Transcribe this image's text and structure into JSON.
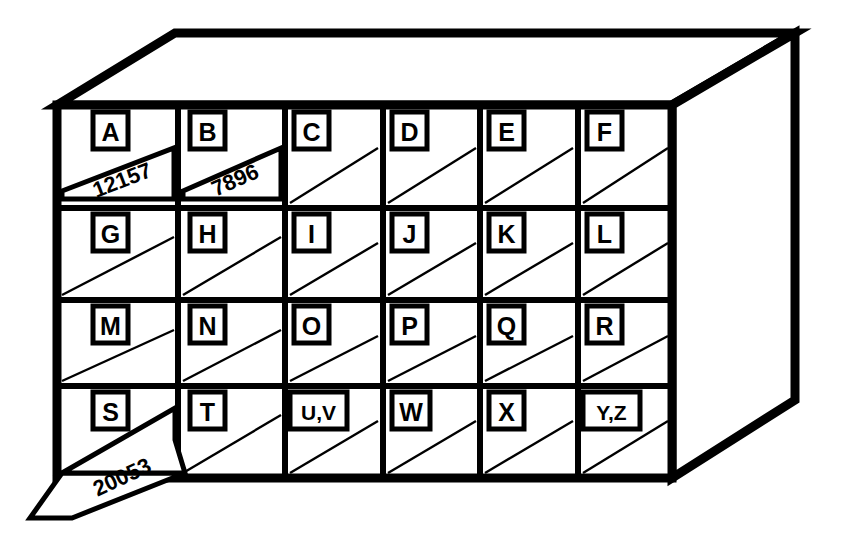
{
  "figure": {
    "line_color": "#000000",
    "fill_color": "#ffffff"
  },
  "cabinet": {
    "rows": 4,
    "columns": 6,
    "slots": [
      {
        "label": "A",
        "row": 0,
        "col": 0
      },
      {
        "label": "B",
        "row": 0,
        "col": 1
      },
      {
        "label": "C",
        "row": 0,
        "col": 2
      },
      {
        "label": "D",
        "row": 0,
        "col": 3
      },
      {
        "label": "E",
        "row": 0,
        "col": 4
      },
      {
        "label": "F",
        "row": 0,
        "col": 5
      },
      {
        "label": "G",
        "row": 1,
        "col": 0
      },
      {
        "label": "H",
        "row": 1,
        "col": 1
      },
      {
        "label": "I",
        "row": 1,
        "col": 2
      },
      {
        "label": "J",
        "row": 1,
        "col": 3
      },
      {
        "label": "K",
        "row": 1,
        "col": 4
      },
      {
        "label": "L",
        "row": 1,
        "col": 5
      },
      {
        "label": "M",
        "row": 2,
        "col": 0
      },
      {
        "label": "N",
        "row": 2,
        "col": 1
      },
      {
        "label": "O",
        "row": 2,
        "col": 2
      },
      {
        "label": "P",
        "row": 2,
        "col": 3
      },
      {
        "label": "Q",
        "row": 2,
        "col": 4
      },
      {
        "label": "R",
        "row": 2,
        "col": 5
      },
      {
        "label": "S",
        "row": 3,
        "col": 0
      },
      {
        "label": "T",
        "row": 3,
        "col": 1
      },
      {
        "label": "U,V",
        "row": 3,
        "col": 2
      },
      {
        "label": "W",
        "row": 3,
        "col": 3
      },
      {
        "label": "X",
        "row": 3,
        "col": 4
      },
      {
        "label": "Y,Z",
        "row": 3,
        "col": 5
      }
    ]
  },
  "cards": [
    {
      "number": "12157",
      "slot": "A",
      "state": "inserted"
    },
    {
      "number": "7896",
      "slot": "B",
      "state": "inserted"
    },
    {
      "number": "20053",
      "slot": "S",
      "state": "pulled-out"
    }
  ]
}
